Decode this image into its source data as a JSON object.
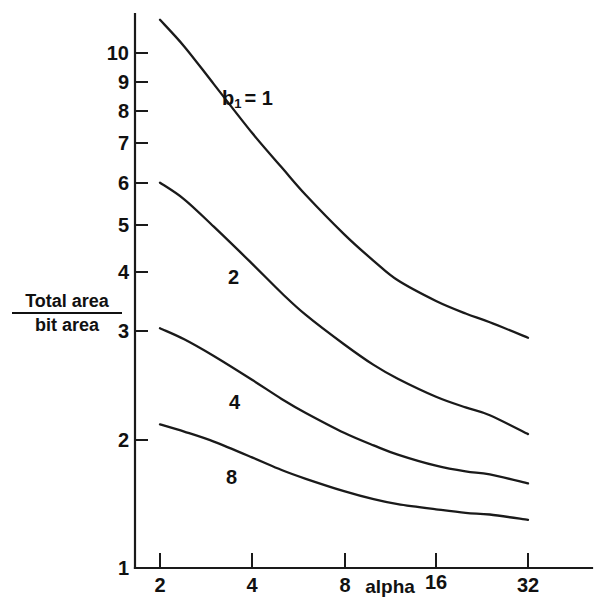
{
  "figure": {
    "background_color": "#ffffff",
    "ink_color": "#1a1a1a"
  },
  "axes": {
    "x_title": "alpha",
    "y_title_numerator": "Total area",
    "y_title_denominator": "bit area",
    "x_tick_labels": [
      "2",
      "4",
      "8",
      "16",
      "32"
    ],
    "y_tick_labels": [
      "10",
      "9",
      "8",
      "7",
      "6",
      "5",
      "4",
      "3",
      "2",
      "1"
    ]
  },
  "curve_labels": {
    "first_prefix": "b",
    "first_subscript": "1",
    "first_equals": "= 1",
    "second": "2",
    "third": "4",
    "fourth": "8"
  },
  "chart_data": {
    "type": "line",
    "title": "",
    "xlabel": "alpha",
    "ylabel": "Total area / bit area",
    "xscale": "log",
    "yscale": "log",
    "xlim": [
      1.8,
      32
    ],
    "ylim": [
      1,
      11
    ],
    "xticks": [
      2,
      4,
      8,
      16,
      32
    ],
    "yticks": [
      1,
      2,
      3,
      4,
      5,
      6,
      7,
      8,
      9,
      10
    ],
    "grid": false,
    "legend": "inline-curve-labels",
    "x": [
      2,
      2.4,
      3,
      4,
      5,
      6,
      8,
      10,
      12,
      16,
      20,
      24,
      32
    ],
    "series": [
      {
        "name": "b1 = 1",
        "label": "b_1 = 1",
        "values": [
          11.6,
          10.3,
          8.7,
          7.0,
          6.0,
          5.3,
          4.45,
          3.95,
          3.62,
          3.3,
          3.12,
          3.0,
          2.8
        ]
      },
      {
        "name": "2",
        "label": "2",
        "values": [
          5.6,
          5.2,
          4.6,
          3.9,
          3.42,
          3.1,
          2.72,
          2.48,
          2.33,
          2.15,
          2.05,
          1.98,
          1.82
        ]
      },
      {
        "name": "4",
        "label": "4",
        "values": [
          2.92,
          2.78,
          2.58,
          2.32,
          2.13,
          2.0,
          1.83,
          1.73,
          1.66,
          1.58,
          1.54,
          1.52,
          1.46
        ]
      },
      {
        "name": "8",
        "label": "8",
        "values": [
          1.9,
          1.84,
          1.76,
          1.64,
          1.55,
          1.49,
          1.41,
          1.36,
          1.33,
          1.3,
          1.28,
          1.27,
          1.24
        ]
      }
    ]
  }
}
